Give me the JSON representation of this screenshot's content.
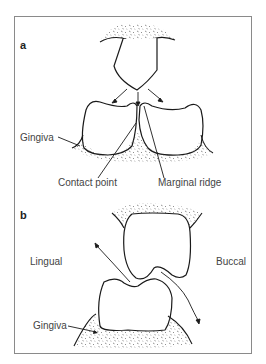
{
  "figure": {
    "panels": [
      {
        "id": "a",
        "label": "a",
        "annotations": {
          "gingiva": "Gingiva",
          "contact_point": "Contact point",
          "marginal_ridge": "Marginal ridge"
        }
      },
      {
        "id": "b",
        "label": "b",
        "annotations": {
          "lingual": "Lingual",
          "buccal": "Buccal",
          "gingiva": "Gingiva"
        }
      }
    ],
    "colors": {
      "line": "#1a1a1a",
      "text": "#444444",
      "frame": "#8a8a8a"
    }
  }
}
